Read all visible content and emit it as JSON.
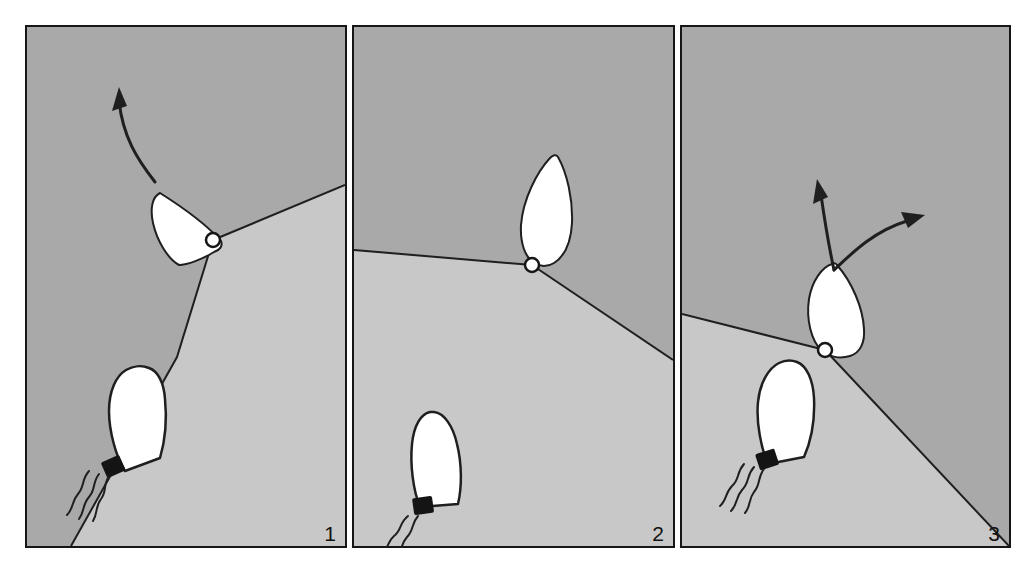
{
  "figure": {
    "background_color": "#ffffff",
    "border_color": "#161616",
    "dark_field_color": "#a9a9a9",
    "light_field_color": "#c8c8c8",
    "cell_fill_color": "#ffffff",
    "outline_color": "#1a1a1a",
    "nucleus_color": "#141414"
  },
  "panels": [
    {
      "id": "panel-1",
      "number": "1",
      "caption": "",
      "vertex_marker": {
        "name": "junction-node",
        "cx": 186,
        "cy": 213,
        "r": 7
      },
      "arrows": [
        {
          "name": "migration-arrow",
          "direction": "up-left",
          "start": [
            128,
            155
          ],
          "end": [
            92,
            66
          ]
        }
      ],
      "cells": [
        {
          "name": "leaf-cell",
          "type": "spindle",
          "orientation": "up-left",
          "flagella": 0
        },
        {
          "name": "flagellated-cell",
          "type": "rocket",
          "orientation": "up-right",
          "flagella": 3
        }
      ],
      "boundaries": [
        "vertex-to-top-right",
        "vertex-to-bottom-left"
      ]
    },
    {
      "id": "panel-2",
      "number": "2",
      "caption": "",
      "vertex_marker": {
        "name": "junction-node",
        "cx": 178,
        "cy": 238,
        "r": 7
      },
      "arrows": [],
      "cells": [
        {
          "name": "leaf-cell",
          "type": "spindle",
          "orientation": "up-slight-left",
          "flagella": 0
        },
        {
          "name": "flagellated-cell",
          "type": "rocket",
          "orientation": "up-right",
          "flagella": 2
        }
      ],
      "boundaries": [
        "vertex-to-left-edge",
        "vertex-to-right-edge"
      ]
    },
    {
      "id": "panel-3",
      "number": "3",
      "caption": "",
      "vertex_marker": {
        "name": "junction-node",
        "cx": 143,
        "cy": 323,
        "r": 7
      },
      "arrows": [
        {
          "name": "migration-arrow-left",
          "direction": "up",
          "start": [
            150,
            243
          ],
          "end": [
            139,
            155
          ]
        },
        {
          "name": "migration-arrow-right",
          "direction": "up-right",
          "start": [
            150,
            243
          ],
          "end": [
            243,
            183
          ]
        }
      ],
      "cells": [
        {
          "name": "leaf-cell",
          "type": "spindle",
          "orientation": "up-slight-left",
          "flagella": 0
        },
        {
          "name": "flagellated-cell",
          "type": "rocket",
          "orientation": "up-right",
          "flagella": 3
        }
      ],
      "boundaries": [
        "vertex-to-left-edge",
        "vertex-to-bottom-right"
      ]
    }
  ]
}
